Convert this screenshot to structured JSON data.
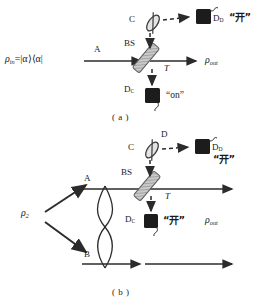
{
  "figure": {
    "type": "optics-schematic",
    "panels": [
      {
        "id": "a",
        "caption": "( a )",
        "input_state": "ρ",
        "input_state_sub": "in",
        "input_state_rest": "=|α⟩⟨α|",
        "arm_a_label": "A",
        "beamsplitter_label": "BS",
        "transmission_label": "T",
        "ancilla_label": "C",
        "detector_d_label": "D",
        "detector_d_sub": "D",
        "detector_d_reading": "“开”",
        "detector_c_label": "D",
        "detector_c_sub": "C",
        "detector_c_reading": "“on”",
        "output_state": "ρ",
        "output_state_sub": "out"
      },
      {
        "id": "b",
        "caption": "( b )",
        "input_state": "ρ",
        "input_state_sub": "2",
        "arm_a_label": "A",
        "arm_b_label": "B",
        "beamsplitter_label": "BS",
        "transmission_label": "T",
        "ancilla_label": "C",
        "mode_d_label": "D",
        "detector_d_label": "D",
        "detector_d_sub": "D",
        "detector_d_reading": "“开”",
        "detector_c_label": "D",
        "detector_c_sub": "C",
        "detector_c_reading": "“开”",
        "output_state": "ρ",
        "output_state_sub": "out"
      }
    ],
    "colors": {
      "line": "#2b2b2b",
      "detector_fill": "#1c1c1c",
      "hatch": "#8a8a8a",
      "background": "#ffffff"
    }
  }
}
